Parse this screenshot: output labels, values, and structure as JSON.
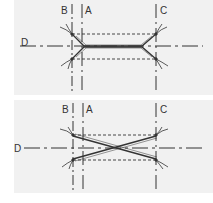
{
  "diagrams": [
    {
      "id": "top",
      "variant": "parallel-tapered",
      "labels": {
        "a": "A",
        "b": "B",
        "c": "C",
        "d": "D"
      }
    },
    {
      "id": "bottom",
      "variant": "crossed",
      "labels": {
        "a": "A",
        "b": "B",
        "c": "C",
        "d": "D"
      }
    }
  ],
  "colors": {
    "line": "#333333",
    "panel": "#f1f1f1",
    "background": "#ffffff"
  }
}
